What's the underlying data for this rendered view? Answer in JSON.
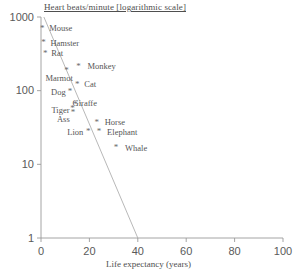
{
  "chart_data": {
    "type": "scatter",
    "title": "Heart beats/minute [logarithmic  scale]",
    "xlabel": "Life expectancy (years)",
    "ylabel": "Heart beats/minute [logarithmic  scale]",
    "xlim": [
      0,
      100
    ],
    "ylim": [
      1,
      1000
    ],
    "yscale": "log",
    "xscale": "linear",
    "grid": false,
    "legend": "none",
    "xticks": [
      "0",
      "20",
      "40",
      "60",
      "80",
      "100"
    ],
    "xtick_values": [
      0,
      20,
      40,
      60,
      80,
      100
    ],
    "yticks": [
      "1",
      "10",
      "100",
      "1000"
    ],
    "ytick_values": [
      1,
      10,
      100,
      1000
    ],
    "points": [
      {
        "label": "Mouse",
        "x": 0.5,
        "y": 700,
        "label_dx": 7,
        "label_dy": -4
      },
      {
        "label": "Hamster",
        "x": 1.0,
        "y": 450,
        "label_dx": 7,
        "label_dy": -4
      },
      {
        "label": "Rat",
        "x": 1.8,
        "y": 320,
        "label_dx": 6,
        "label_dy": -4
      },
      {
        "label": "Marmot",
        "x": 10.5,
        "y": 190,
        "label_dx": -21,
        "label_dy": 4
      },
      {
        "label": "Monkey",
        "x": 15.5,
        "y": 215,
        "label_dx": 9,
        "label_dy": -4
      },
      {
        "label": "Cat",
        "x": 15.0,
        "y": 122,
        "label_dx": 7,
        "label_dy": -4
      },
      {
        "label": "Dog",
        "x": 12.0,
        "y": 97,
        "label_dx": -19,
        "label_dy": -4
      },
      {
        "label": "Giraffe",
        "x": 14.3,
        "y": 66,
        "label_dx": -3,
        "label_dy": -5
      },
      {
        "label": "Tiger",
        "x": 13.0,
        "y": 57,
        "label_dx": -21,
        "label_dy": -3
      },
      {
        "label": "Ass",
        "x": 13.2,
        "y": 50,
        "label_dx": -16,
        "label_dy": 2
      },
      {
        "label": "Horse",
        "x": 23.0,
        "y": 37,
        "label_dx": 8,
        "label_dy": -4
      },
      {
        "label": "Lion",
        "x": 19.5,
        "y": 28,
        "label_dx": -21,
        "label_dy": -3
      },
      {
        "label": "Elephant",
        "x": 24.0,
        "y": 28,
        "label_dx": 8,
        "label_dy": -3
      },
      {
        "label": "Whale",
        "x": 31.0,
        "y": 17,
        "label_dx": 9,
        "label_dy": -3
      }
    ],
    "trendline": {
      "x_start": 1.2,
      "y_start": 1000,
      "x_end": 40.0,
      "y_end": 1.0
    },
    "colors": {
      "axis": "#9a9a9a",
      "marker": "#6a6a6a",
      "text": "#4f4f4f",
      "trendline": "#b0b0b0",
      "background": "#ffffff"
    }
  }
}
